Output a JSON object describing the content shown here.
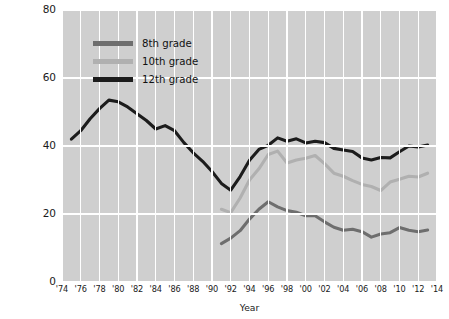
{
  "chart_data": {
    "type": "line",
    "title": "",
    "xlabel": "Year",
    "ylabel": "Trends in the percent of U.S. adolescents  who have used an illicit drug in the last 12 months",
    "xlim": [
      1974,
      2014
    ],
    "ylim": [
      0,
      80
    ],
    "yticks": [
      0,
      20,
      40,
      60,
      80
    ],
    "ytick_labels": [
      "0",
      "20",
      "40",
      "60",
      "80"
    ],
    "xticks": [
      1974,
      1976,
      1978,
      1980,
      1982,
      1984,
      1986,
      1988,
      1990,
      1992,
      1994,
      1996,
      1998,
      2000,
      2002,
      2004,
      2006,
      2008,
      2010,
      2012,
      2014
    ],
    "xtick_labels": [
      "'74",
      "'76",
      "'78",
      "'80",
      "'82",
      "'84",
      "'86",
      "'88",
      "'90",
      "'92",
      "'94",
      "'96",
      "'98",
      "'00",
      "'02",
      "'04",
      "'06",
      "'08",
      "'10",
      "'12",
      "'14"
    ],
    "grid": true,
    "grid_color": "#ffffff",
    "plot_background": "#cfcfcf",
    "legend_position": "upper-center-left",
    "series": [
      {
        "name": "8th grade",
        "color": "#6e6e6e",
        "x": [
          1991,
          1992,
          1993,
          1994,
          1995,
          1996,
          1997,
          1998,
          1999,
          2000,
          2001,
          2002,
          2003,
          2004,
          2005,
          2006,
          2007,
          2008,
          2009,
          2010,
          2011,
          2012,
          2013
        ],
        "values": [
          11.3,
          12.9,
          15.1,
          18.5,
          21.4,
          23.6,
          22.1,
          21.0,
          20.5,
          19.5,
          19.5,
          17.7,
          16.1,
          15.2,
          15.5,
          14.8,
          13.2,
          14.1,
          14.5,
          16.0,
          15.2,
          14.8,
          15.3
        ]
      },
      {
        "name": "10th grade",
        "color": "#b0b0b0",
        "x": [
          1991,
          1992,
          1993,
          1994,
          1995,
          1996,
          1997,
          1998,
          1999,
          2000,
          2001,
          2002,
          2003,
          2004,
          2005,
          2006,
          2007,
          2008,
          2009,
          2010,
          2011,
          2012,
          2013
        ],
        "values": [
          21.4,
          20.4,
          24.7,
          30.0,
          33.3,
          37.5,
          38.5,
          35.0,
          35.9,
          36.4,
          37.2,
          34.8,
          32.0,
          31.1,
          29.8,
          28.7,
          28.1,
          26.9,
          29.4,
          30.2,
          31.1,
          30.9,
          32.0
        ]
      },
      {
        "name": "12th grade",
        "color": "#1c1c1c",
        "x": [
          1975,
          1976,
          1977,
          1978,
          1979,
          1980,
          1981,
          1982,
          1983,
          1984,
          1985,
          1986,
          1987,
          1988,
          1989,
          1990,
          1991,
          1992,
          1993,
          1994,
          1995,
          1996,
          1997,
          1998,
          1999,
          2000,
          2001,
          2002,
          2003,
          2004,
          2005,
          2006,
          2007,
          2008,
          2009,
          2010,
          2011,
          2012,
          2013
        ],
        "values": [
          42.0,
          44.5,
          48.0,
          51.0,
          53.5,
          53.0,
          51.5,
          49.5,
          47.5,
          45.0,
          46.0,
          44.5,
          41.0,
          38.0,
          35.5,
          32.5,
          29.0,
          27.0,
          31.0,
          35.8,
          39.0,
          40.2,
          42.4,
          41.4,
          42.1,
          40.9,
          41.4,
          41.0,
          39.3,
          38.8,
          38.4,
          36.5,
          35.9,
          36.6,
          36.5,
          38.3,
          40.0,
          39.7,
          40.3
        ]
      }
    ]
  },
  "legend": {
    "items": [
      {
        "label": "8th grade",
        "color": "#6e6e6e"
      },
      {
        "label": "10th grade",
        "color": "#b0b0b0"
      },
      {
        "label": "12th grade",
        "color": "#1c1c1c"
      }
    ]
  }
}
